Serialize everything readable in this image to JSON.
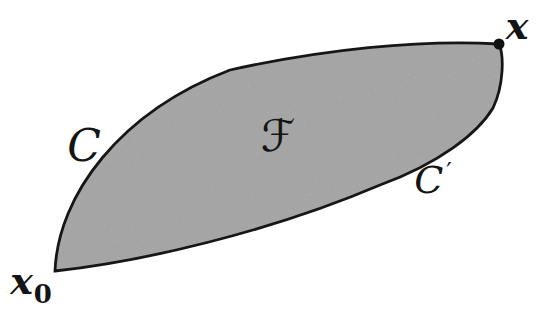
{
  "figure": {
    "region_label": "ℱ",
    "upper_curve_label": "C",
    "lower_curve_label": {
      "base": "C",
      "prime": "′"
    },
    "end_point_label": "x",
    "start_point_label": {
      "base": "x",
      "sub": "0"
    },
    "colors": {
      "region_fill": "#c6c6c6",
      "outline": "#161616",
      "point_dot": "#111111",
      "background": "#ffffff"
    }
  }
}
